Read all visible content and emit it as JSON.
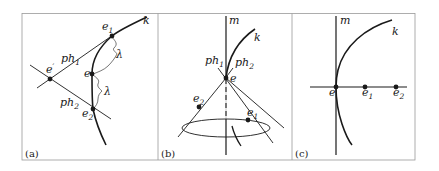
{
  "figure": {
    "panels": [
      {
        "id": "a",
        "label": "(a)",
        "points": [
          {
            "name": "e'",
            "base": "e",
            "sup": "′",
            "sub": ""
          },
          {
            "name": "e1",
            "base": "e",
            "sub": "1"
          },
          {
            "name": "e",
            "base": "e",
            "sub": ""
          },
          {
            "name": "e2",
            "base": "e",
            "sub": "2"
          }
        ],
        "lines": [
          {
            "name": "ph1",
            "base": "ph",
            "sub": "1"
          },
          {
            "name": "ph2",
            "base": "ph",
            "sub": "2"
          }
        ],
        "curve": "k",
        "distances": [
          "λ",
          "λ"
        ]
      },
      {
        "id": "b",
        "label": "(b)",
        "axis": "m",
        "curve": "k",
        "points": [
          {
            "name": "e",
            "base": "e",
            "sub": ""
          },
          {
            "name": "e2",
            "base": "e",
            "sub": "2"
          },
          {
            "name": "e1",
            "base": "e",
            "sub": "1"
          }
        ],
        "lines": [
          {
            "name": "ph1",
            "base": "ph",
            "sub": "1"
          },
          {
            "name": "ph2",
            "base": "ph",
            "sub": "2"
          }
        ]
      },
      {
        "id": "c",
        "label": "(c)",
        "axis": "m",
        "curve": "k",
        "points": [
          {
            "name": "e",
            "base": "e",
            "sub": ""
          },
          {
            "name": "e1",
            "base": "e",
            "sub": "1"
          },
          {
            "name": "e2",
            "base": "e",
            "sub": "2"
          }
        ]
      }
    ],
    "colors": {
      "ink": "#1a1a1a",
      "frame": "#9a9a9a"
    }
  }
}
